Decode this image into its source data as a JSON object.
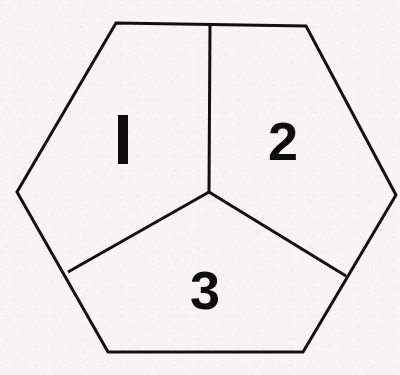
{
  "figure": {
    "title": "Hexagon divided into three regions",
    "shape_name": "hexagon",
    "background_color": "#f6f5f3",
    "stroke_color": "#111111",
    "stroke_width": 3,
    "label_color": "#0d0d0d",
    "outline": {
      "name": "hexagon-outline",
      "points": "116,23 306,26 396,195 303,352 108,352 17,192",
      "vertices": [
        {
          "name": "top-left-vertex",
          "x": 116,
          "y": 23
        },
        {
          "name": "top-right-vertex",
          "x": 306,
          "y": 26
        },
        {
          "name": "right-vertex",
          "x": 396,
          "y": 195
        },
        {
          "name": "bottom-right-vertex",
          "x": 303,
          "y": 352
        },
        {
          "name": "bottom-left-vertex",
          "x": 108,
          "y": 352
        },
        {
          "name": "left-vertex",
          "x": 17,
          "y": 192
        }
      ]
    },
    "center_vertex": {
      "name": "center-junction",
      "x": 209,
      "y": 192
    },
    "internal_edges": [
      {
        "name": "edge-center-to-top",
        "x1": 210,
        "y1": 24,
        "x2": 209,
        "y2": 192
      },
      {
        "name": "edge-center-to-lower-left",
        "x1": 209,
        "y1": 192,
        "x2": 68,
        "y2": 272
      },
      {
        "name": "edge-center-to-lower-right",
        "x1": 209,
        "y1": 192,
        "x2": 346,
        "y2": 276
      }
    ],
    "regions": [
      {
        "name": "region-1",
        "label": "1",
        "label_style": "bar",
        "label_x": 123,
        "label_y": 139,
        "bar_width": 10,
        "bar_height": 49
      },
      {
        "name": "region-2",
        "label": "2",
        "label_style": "glyph",
        "label_x": 283,
        "label_y": 141
      },
      {
        "name": "region-3",
        "label": "3",
        "label_style": "glyph",
        "label_x": 205,
        "label_y": 290
      }
    ]
  }
}
